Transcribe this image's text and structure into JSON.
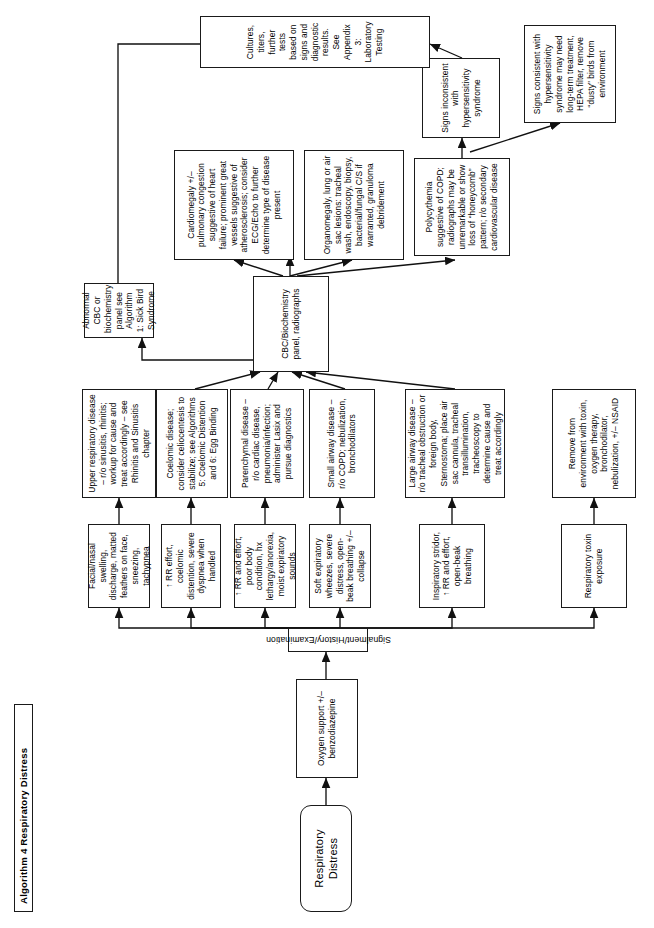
{
  "document": {
    "title": "Algorithm 4 Respiratory Distress",
    "page_width": 654,
    "page_height": 928,
    "orientation": "landscape-rotated"
  },
  "start": {
    "label": "Respiratory Distress"
  },
  "steps": {
    "oxygen": "Oxygen support +/– benzodiazepine",
    "signalment": "Signalment/History/Examination"
  },
  "branches": [
    {
      "id": "toxin",
      "sign": "Respiratory toxin exposure",
      "action": "Remove from environment with toxin, oxygen therapy, bronchodilator, nebulization, +/– NSAID"
    },
    {
      "id": "upper-airway",
      "sign": "Inspiratory stridor, ↑ RR and effort, open-beak breathing",
      "action": "Large airway disease – r/o tracheal obstruction or foreign body, Sternostoma; place air sac cannula, tracheal transillumination, tracheoscopy to determine cause and treat accordingly"
    },
    {
      "id": "small-airway",
      "sign": "Soft expiratory wheezes, severe distress, open-beak breathing +/– collapse",
      "action": "Small airway disease – r/o COPD; nebulization, bronchodilators"
    },
    {
      "id": "parenchymal",
      "sign": "↑ RR and effort, poor body condition, hx lethargy/anorexia, moist expiratory sounds",
      "action": "Parenchymal disease – r/o cardiac disease, pneumonia/infection; administer Lasix and pursue diagnostics"
    },
    {
      "id": "coelomic",
      "sign": "↑ RR effort, coelomic distention, severe dyspnea when handled",
      "action": "Coelomic disease; consider celiocentesis to stabilize; see Algorithms 5: Coelomic Distention and 6: Egg Binding"
    },
    {
      "id": "upper-respiratory",
      "sign": "Facial/nasal swelling, discharge, matted feathers on face, sneezing, tachypnea",
      "action": "Upper respiratory disease – r/o sinusitis, rhinitis; workup for cause and treat accordingly – see Rhinitis and Sinusitis chapter"
    }
  ],
  "diagnostics": {
    "hub": "CBC/Biochemistry panel, radiographs",
    "outcomes": [
      {
        "id": "sick-bird",
        "text": "Abnormal CBC or biochemistry panel see Algorithm 1: Sick Bird Syndrome"
      },
      {
        "id": "cardiomegaly",
        "text": "Cardiomegaly +/– pulmonary congestion suggestive of heart failure; prominent great vessels suggestive of atherosclerosis; consider ECG/Echo to further determine type of disease present"
      },
      {
        "id": "organomegaly",
        "text": "Organomegaly, lung or air sac lesions: tracheal wash, endoscopy, biopsy, bacterial/fungal C/S if warranted, granuloma debridement"
      },
      {
        "id": "polycythemia",
        "text": "Polycythemia suggestive of COPD; radiographs may be unremarkable or show loss of “honeycomb” pattern; r/o secondary cardiovascular disease"
      }
    ]
  },
  "hypersensitivity": {
    "inconsistent": "Signs inconsistent with hypersensitivity syndrome",
    "consistent": "Signs consistent with hypersensitivity syndrome may need long-term treatment, HEPA filter, remove “dusty” birds from environment"
  },
  "final": {
    "text": "Cultures, titers, further tests based on signs and diagnostic results. See Appendix 3: Laboratory Testing"
  },
  "colors": {
    "stroke": "#1a1a1a",
    "background": "#ffffff",
    "text": "#000000"
  }
}
